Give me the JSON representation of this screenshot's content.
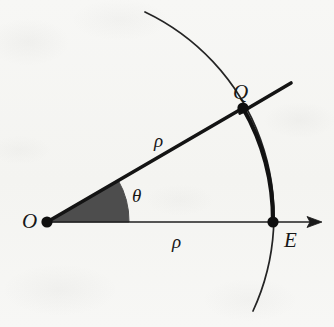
{
  "figure": {
    "kind": "geometry-diagram",
    "background_color": "#f6f6f3",
    "ink_color": "#1a1a1a",
    "sector_fill_color": "#4d4d4d",
    "labels": {
      "origin": "O",
      "arc_point": "Q",
      "axis_point": "E",
      "angle": "θ",
      "radius_upper": "ρ",
      "radius_lower": "ρ"
    },
    "points": [
      {
        "name": "O",
        "label": "O",
        "x": 47,
        "y": 222,
        "dot": true
      },
      {
        "name": "Q",
        "label": "Q",
        "x": 243,
        "y": 108,
        "dot": true
      },
      {
        "name": "E",
        "label": "E",
        "x": 273,
        "y": 222,
        "dot": true
      }
    ],
    "segments": [
      {
        "name": "radius-OQ",
        "label": "ρ",
        "from": "O",
        "to": "Q",
        "weight": "bold"
      },
      {
        "name": "polar-axis-OE",
        "label": "ρ",
        "from": "O",
        "to": "E",
        "weight": "thin",
        "arrow": true
      }
    ],
    "arcs": [
      {
        "name": "circle-arc-thin",
        "center": "O",
        "radius": 226,
        "weight": "thin"
      },
      {
        "name": "circle-arc-bold-QE",
        "center": "O",
        "radius": 226,
        "from": "Q",
        "to": "E",
        "weight": "bold"
      },
      {
        "name": "angle-sector",
        "center": "O",
        "radius": 82,
        "filled": true,
        "from_deg": 0,
        "to_deg": 30
      }
    ],
    "tangent_line": {
      "name": "line-through-Q",
      "through": "Q",
      "weight": "bold"
    },
    "angle_measure_deg": 30
  }
}
